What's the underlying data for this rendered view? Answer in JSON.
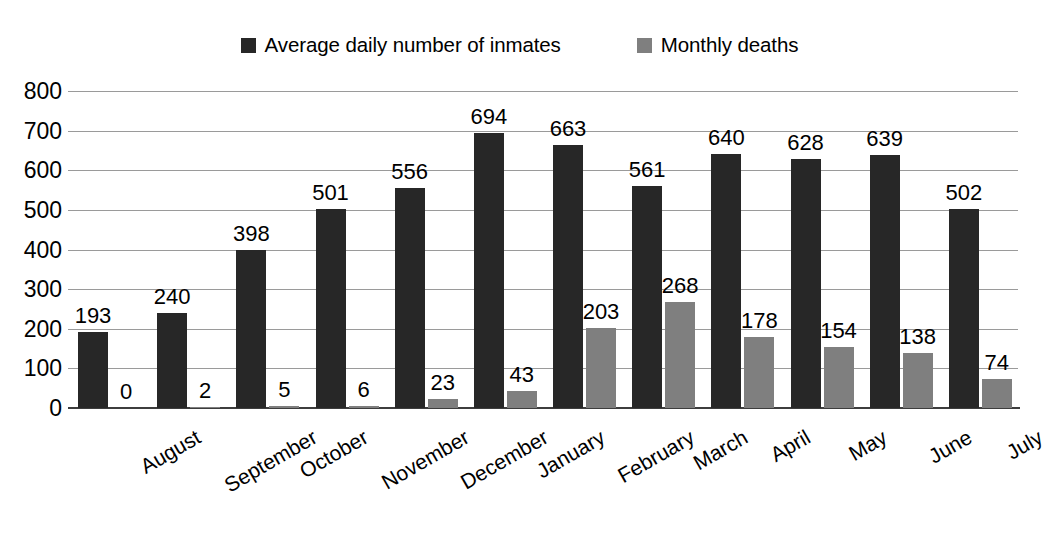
{
  "chart_data": {
    "type": "bar",
    "title": "",
    "subtitle": "",
    "xlabel": "",
    "ylabel": "",
    "ylim": [
      0,
      800
    ],
    "ytick_step": 100,
    "yticks": [
      "800",
      "700",
      "600",
      "500",
      "400",
      "300",
      "200",
      "100",
      "0"
    ],
    "grid": true,
    "legend_position": "top-center",
    "categories": [
      "August",
      "September",
      "October",
      "November",
      "December",
      "January",
      "February",
      "March",
      "April",
      "May",
      "June",
      "July"
    ],
    "series": [
      {
        "name": "Average daily number of inmates",
        "color": "#272727",
        "values": [
          193,
          240,
          398,
          501,
          556,
          694,
          663,
          561,
          640,
          628,
          639,
          502
        ]
      },
      {
        "name": "Monthly deaths",
        "color": "#7f7f7f",
        "values": [
          0,
          2,
          5,
          6,
          23,
          43,
          203,
          268,
          178,
          154,
          138,
          74
        ]
      }
    ]
  },
  "legend": {
    "items": [
      {
        "label": "Average daily number of inmates",
        "color": "#272727",
        "swatch_name": "legend-swatch-inmates"
      },
      {
        "label": "Monthly deaths",
        "color": "#7f7f7f",
        "swatch_name": "legend-swatch-deaths"
      }
    ]
  },
  "colors": {
    "background": "#ffffff",
    "primary_bar": "#272727",
    "secondary_bar": "#7f7f7f",
    "gridline": "#9a9a9a",
    "axis": "#3d3d3d",
    "text": "#000000"
  }
}
